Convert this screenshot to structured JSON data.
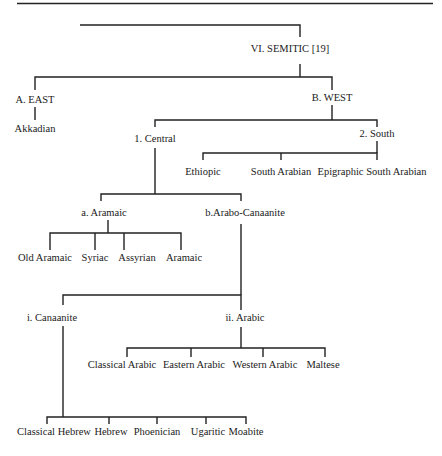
{
  "title": "VI. SEMITIC [19]",
  "colors": {
    "line": "#222222",
    "text": "#1a1a1a",
    "background": "#ffffff"
  },
  "tree": {
    "label": "VI. SEMITIC [19]",
    "children": [
      {
        "label": "A. EAST",
        "children": [
          {
            "label": "Akkadian"
          }
        ]
      },
      {
        "label": "B. WEST",
        "children": [
          {
            "label": "1. Central",
            "children": [
              {
                "label": "a. Aramaic",
                "children": [
                  {
                    "label": "Old Aramaic"
                  },
                  {
                    "label": "Syriac"
                  },
                  {
                    "label": "Assyrian"
                  },
                  {
                    "label": "Aramaic"
                  }
                ]
              },
              {
                "label": "b.Arabo-Canaanite",
                "children": [
                  {
                    "label": "i. Canaanite",
                    "children": [
                      {
                        "label": "Classical Hebrew"
                      },
                      {
                        "label": "Hebrew"
                      },
                      {
                        "label": "Phoenician"
                      },
                      {
                        "label": "Ugaritic"
                      },
                      {
                        "label": "Moabite"
                      }
                    ]
                  },
                  {
                    "label": "ii. Arabic",
                    "children": [
                      {
                        "label": "Classical Arabic"
                      },
                      {
                        "label": "Eastern Arabic"
                      },
                      {
                        "label": "Western Arabic"
                      },
                      {
                        "label": "Maltese"
                      }
                    ]
                  }
                ]
              }
            ]
          },
          {
            "label": "2. South",
            "children": [
              {
                "label": "Ethiopic"
              },
              {
                "label": "South Arabian"
              },
              {
                "label": "Epigraphic South Arabian"
              }
            ]
          }
        ]
      }
    ]
  },
  "labels": {
    "semitic": "VI. SEMITIC [19]",
    "east": "A. EAST",
    "akkadian": "Akkadian",
    "west": "B. WEST",
    "central": "1. Central",
    "south": "2. South",
    "ethiopic": "Ethiopic",
    "south_arabian": "South Arabian",
    "epigraphic_south_arabian": "Epigraphic South Arabian",
    "aramaic_group": "a. Aramaic",
    "arabo_canaanite": "b.Arabo-Canaanite",
    "old_aramaic": "Old Aramaic",
    "syriac": "Syriac",
    "assyrian": "Assyrian",
    "aramaic": "Aramaic",
    "canaanite": "i. Canaanite",
    "arabic": "ii. Arabic",
    "classical_arabic": "Classical Arabic",
    "eastern_arabic": "Eastern Arabic",
    "western_arabic": "Western Arabic",
    "maltese": "Maltese",
    "classical_hebrew": "Classical Hebrew",
    "hebrew": "Hebrew",
    "phoenician": "Phoenician",
    "ugaritic": "Ugaritic",
    "moabite": "Moabite"
  }
}
